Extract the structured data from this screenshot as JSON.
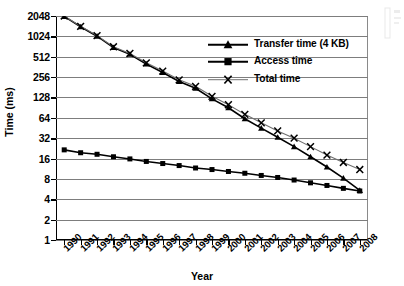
{
  "chart_data": {
    "type": "line",
    "title": "",
    "xlabel": "Year",
    "ylabel": "Time (ms)",
    "yscale": "log2",
    "ylim": [
      1,
      2048
    ],
    "ytick_labels": [
      "2048",
      "1024",
      "512",
      "256",
      "128",
      "64",
      "32",
      "16",
      "8",
      "4",
      "2",
      "1"
    ],
    "ytick_values": [
      2048,
      1024,
      512,
      256,
      128,
      64,
      32,
      16,
      8,
      4,
      2,
      1
    ],
    "grid": true,
    "legend_position": "upper-right",
    "categories": [
      "1990",
      "1991",
      "1992",
      "1993",
      "1994",
      "1995",
      "1996",
      "1997",
      "1998",
      "1999",
      "2000",
      "2001",
      "2002",
      "2003",
      "2004",
      "2005",
      "2006",
      "2007",
      "2008"
    ],
    "x": [
      1990,
      1991,
      1992,
      1993,
      1994,
      1995,
      1996,
      1997,
      1998,
      1999,
      2000,
      2001,
      2002,
      2003,
      2004,
      2005,
      2006,
      2007,
      2008
    ],
    "series": [
      {
        "name": "Transfer time (4 KB)",
        "marker": "triangle",
        "color": "#000000",
        "values": [
          2020,
          1420,
          1030,
          700,
          555,
          400,
          300,
          220,
          175,
          122,
          90,
          62,
          45,
          33,
          24,
          17,
          12,
          8.2,
          5.4
        ]
      },
      {
        "name": "Access time",
        "marker": "square",
        "color": "#000000",
        "values": [
          21.5,
          19.5,
          18.5,
          17.0,
          15.8,
          14.5,
          13.5,
          12.6,
          11.6,
          11.0,
          10.3,
          9.7,
          9.0,
          8.4,
          7.7,
          7.0,
          6.4,
          5.8,
          5.3
        ]
      },
      {
        "name": "Total time",
        "marker": "x",
        "color": "#6f6f6f",
        "values": [
          2048,
          1440,
          1050,
          718,
          572,
          416,
          314,
          233,
          187,
          133,
          100,
          72,
          54,
          41,
          32,
          24,
          18,
          14,
          11
        ]
      }
    ]
  },
  "axes": {
    "y_title": "Time (ms)",
    "x_title": "Year"
  },
  "legend": {
    "items": [
      {
        "label": "Transfer time (4 KB)",
        "marker": "triangle-marker-icon"
      },
      {
        "label": "Access time",
        "marker": "square-marker-icon"
      },
      {
        "label": "Total time",
        "marker": "x-marker-icon"
      }
    ]
  }
}
